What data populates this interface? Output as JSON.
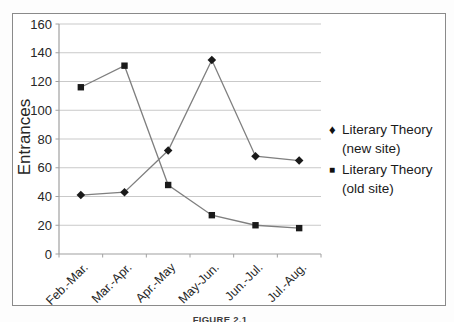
{
  "figure": {
    "caption": "FIGURE 2.1"
  },
  "chart_data": {
    "type": "line",
    "title": "",
    "xlabel": "",
    "ylabel": "Entrances",
    "ylim": [
      0,
      160
    ],
    "ytick_step": 20,
    "grid": "horizontal",
    "legend_position": "right",
    "categories": [
      "Feb.-Mar.",
      "Mar.-Apr.",
      "Apr.-May",
      "May-Jun.",
      "Jun.-Jul.",
      "Jul.-Aug."
    ],
    "series": [
      {
        "name": "Literary Theory (new site)",
        "marker": "diamond",
        "marker_glyph": "♦",
        "values": [
          41,
          43,
          72,
          135,
          68,
          65
        ]
      },
      {
        "name": "Literary Theory (old site)",
        "marker": "square",
        "marker_glyph": "■",
        "values": [
          116,
          131,
          48,
          27,
          20,
          18
        ]
      }
    ],
    "colors": {
      "line": "#7f7f7f",
      "marker": "#1a1a1a",
      "gridline": "#c9c9c9",
      "axis": "#a0a0a0",
      "text": "#262626",
      "frame_border": "#8a8a8a"
    }
  }
}
